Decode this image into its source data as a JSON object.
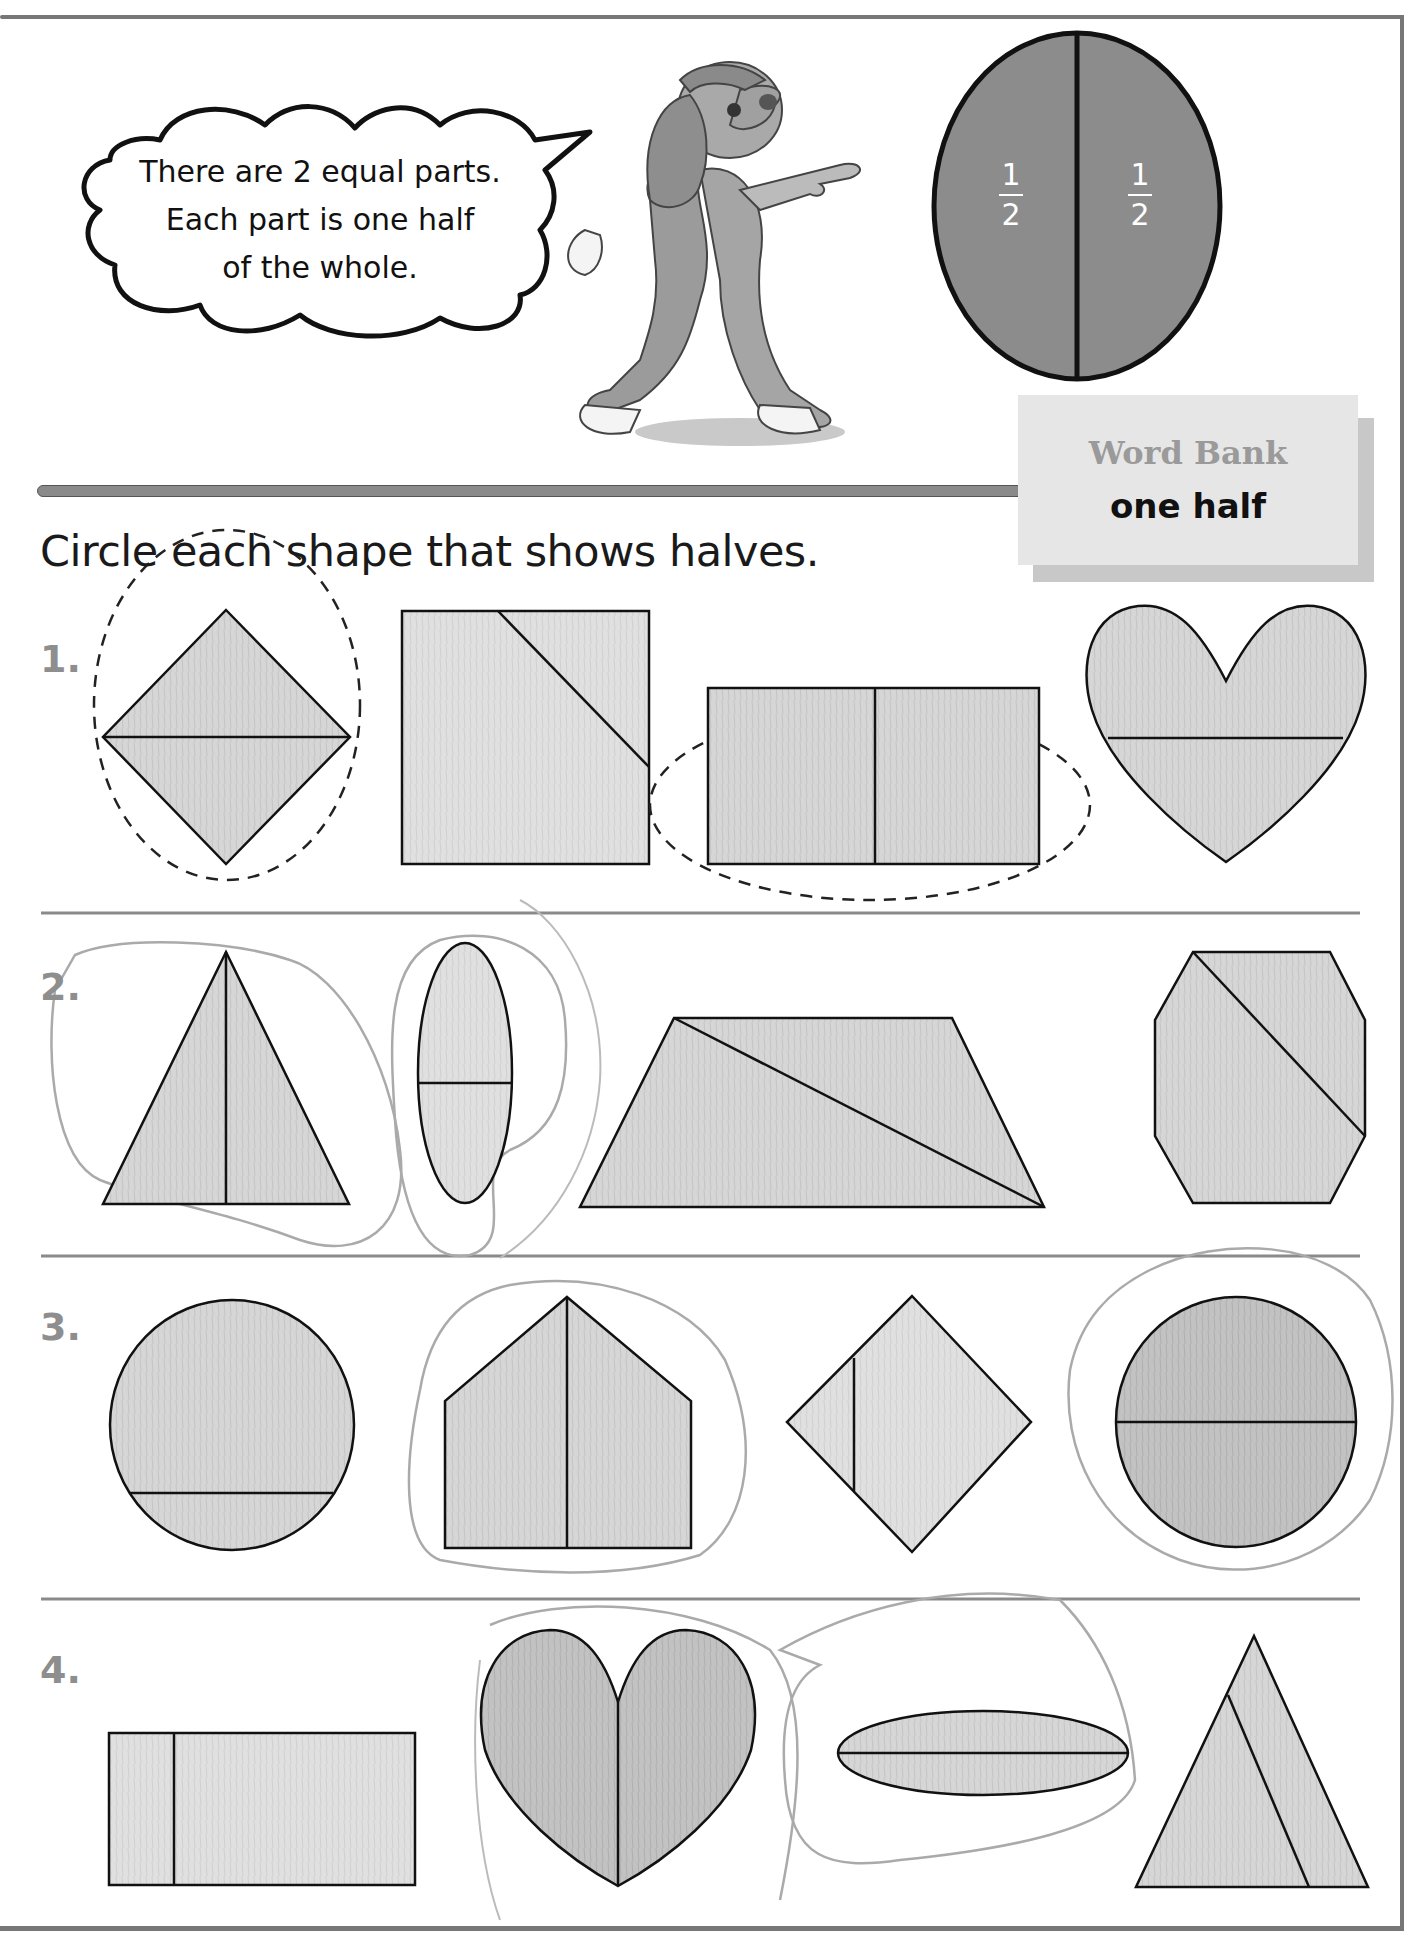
{
  "speech_bubble": {
    "lines": [
      "There are 2 equal parts.",
      "Each part is one half",
      "of the whole."
    ]
  },
  "example_circle": {
    "labels": [
      {
        "numerator": "1",
        "denominator": "2"
      },
      {
        "numerator": "1",
        "denominator": "2"
      }
    ],
    "fill": "#8c8c8c"
  },
  "word_bank": {
    "title": "Word Bank",
    "words": [
      "one half"
    ]
  },
  "instruction": "Circle each shape that shows halves.",
  "colors": {
    "shape_fill": "#d4d4d4",
    "shape_fill_dark": "#bdbdbd",
    "outline": "#111111",
    "row_number": "#8e8e8e",
    "pencil": "#a8a8a8"
  },
  "rows": [
    {
      "number": "1.",
      "shapes": [
        {
          "shape": "diamond",
          "division": "horizontal",
          "halves": true,
          "circled": "example-dashed"
        },
        {
          "shape": "rectangle",
          "division": "diagonal-corner",
          "halves": false,
          "circled": "none"
        },
        {
          "shape": "rectangle",
          "division": "vertical",
          "halves": true,
          "circled": "example-dashed"
        },
        {
          "shape": "heart",
          "division": "horizontal",
          "halves": false,
          "circled": "none"
        }
      ]
    },
    {
      "number": "2.",
      "shapes": [
        {
          "shape": "triangle",
          "division": "vertical",
          "halves": true,
          "circled": "pencil"
        },
        {
          "shape": "oval",
          "division": "horizontal",
          "halves": true,
          "circled": "pencil"
        },
        {
          "shape": "trapezoid",
          "division": "diagonal",
          "halves": false,
          "circled": "none"
        },
        {
          "shape": "octagon",
          "division": "diagonal",
          "halves": false,
          "circled": "none"
        }
      ]
    },
    {
      "number": "3.",
      "shapes": [
        {
          "shape": "circle",
          "division": "horizontal-low",
          "halves": false,
          "circled": "none"
        },
        {
          "shape": "pentagon",
          "division": "vertical",
          "halves": true,
          "circled": "pencil"
        },
        {
          "shape": "diamond",
          "division": "vertical-off-center",
          "halves": false,
          "circled": "none"
        },
        {
          "shape": "circle",
          "division": "horizontal",
          "halves": true,
          "circled": "pencil"
        }
      ]
    },
    {
      "number": "4.",
      "shapes": [
        {
          "shape": "rectangle",
          "division": "vertical-off-center",
          "halves": false,
          "circled": "none"
        },
        {
          "shape": "heart",
          "division": "vertical",
          "halves": true,
          "circled": "pencil"
        },
        {
          "shape": "oval",
          "division": "horizontal",
          "halves": true,
          "circled": "pencil"
        },
        {
          "shape": "triangle",
          "division": "slanted",
          "halves": false,
          "circled": "none"
        }
      ]
    }
  ]
}
